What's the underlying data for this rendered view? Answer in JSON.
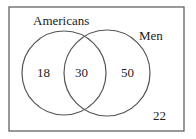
{
  "diagram": {
    "type": "venn",
    "sets": [
      {
        "name": "Americans",
        "only": "18"
      },
      {
        "name": "Men",
        "only": "50"
      }
    ],
    "intersection": "30",
    "outside": "22"
  },
  "colors": {
    "line": "#555555",
    "text": "#222222",
    "background": "#ffffff"
  }
}
